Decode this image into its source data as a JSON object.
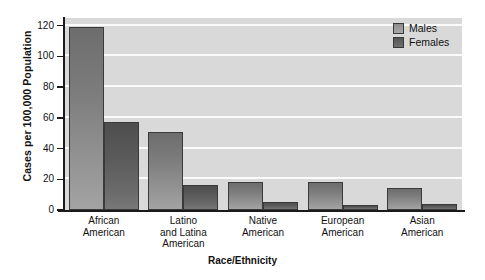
{
  "chart_data": {
    "type": "bar",
    "title": "",
    "xlabel": "Race/Ethnicity",
    "ylabel": "Cases per 100,000 Population",
    "categories": [
      "African American",
      "Latino and Latina American",
      "Native American",
      "European American",
      "Asian American"
    ],
    "category_label_lines": [
      [
        "African",
        "American"
      ],
      [
        "Latino",
        "and Latina",
        "American"
      ],
      [
        "Native",
        "American"
      ],
      [
        "European",
        "American"
      ],
      [
        "Asian",
        "American"
      ]
    ],
    "series": [
      {
        "name": "Males",
        "values": [
          119,
          51,
          18.5,
          18,
          14.5
        ]
      },
      {
        "name": "Females",
        "values": [
          57,
          16,
          5.5,
          3.5,
          4
        ]
      }
    ],
    "ylim": [
      0,
      125
    ],
    "yticks": [
      0,
      20,
      40,
      60,
      80,
      100,
      120
    ],
    "ytick_labels": [
      "0",
      "20",
      "40",
      "60",
      "80",
      "100",
      "120"
    ],
    "grid": "horizontal",
    "gridlines_at": [
      20,
      40,
      60,
      80,
      100,
      120
    ],
    "legend_position": "top-right",
    "legend": [
      "Males",
      "Females"
    ],
    "colors": {
      "plot_background": "#d9d9d9",
      "gridline": "#fbfbfb",
      "axis": "#1a1a1a",
      "males_bar": "#8d8d8d",
      "females_bar": "#5a5a5a",
      "bar_outline": "#3a3a3a",
      "text": "#111111",
      "page_background": "#ffffff"
    }
  }
}
